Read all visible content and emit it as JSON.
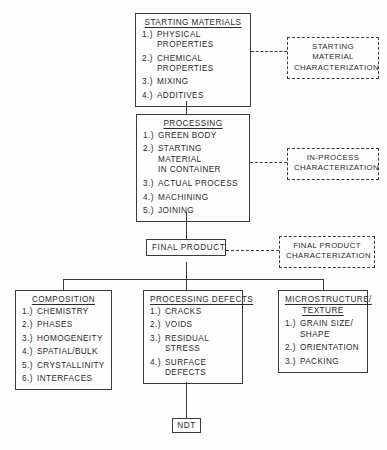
{
  "diagram": {
    "stroke_color": "#3a3a3a",
    "background_color": "#fdfdfd"
  },
  "boxes": {
    "starting_materials": {
      "title": "STARTING MATERIALS",
      "items": [
        {
          "num": "1.)",
          "text": "PHYSICAL PROPERTIES"
        },
        {
          "num": "2.)",
          "text": "CHEMICAL PROPERTIES"
        },
        {
          "num": "3.)",
          "text": "MIXING"
        },
        {
          "num": "4.)",
          "text": "ADDITIVES"
        }
      ]
    },
    "processing": {
      "title": "PROCESSING",
      "items": [
        {
          "num": "1.)",
          "text": "GREEN BODY"
        },
        {
          "num": "2.)",
          "text": "STARTING MATERIAL\n     IN CONTAINER"
        },
        {
          "num": "3.)",
          "text": "ACTUAL PROCESS"
        },
        {
          "num": "4.)",
          "text": "MACHINING"
        },
        {
          "num": "5.)",
          "text": "JOINING"
        }
      ]
    },
    "final_product": {
      "label": "FINAL PRODUCT"
    },
    "composition": {
      "title": "COMPOSITION",
      "items": [
        {
          "num": "1.)",
          "text": "CHEMISTRY"
        },
        {
          "num": "2.)",
          "text": "PHASES"
        },
        {
          "num": "3.)",
          "text": "HOMOGENEITY"
        },
        {
          "num": "4.)",
          "text": "SPATIAL/BULK"
        },
        {
          "num": "5.)",
          "text": "CRYSTALLINITY"
        },
        {
          "num": "6.)",
          "text": "INTERFACES"
        }
      ]
    },
    "processing_defects": {
      "title": "PROCESSING DEFECTS",
      "items": [
        {
          "num": "1.)",
          "text": "CRACKS"
        },
        {
          "num": "2.)",
          "text": "VOIDS"
        },
        {
          "num": "3.)",
          "text": "RESIDUAL STRESS"
        },
        {
          "num": "4.)",
          "text": "SURFACE DEFECTS"
        }
      ]
    },
    "microstructure": {
      "title": "MICROSTRUCTURE/\nTEXTURE",
      "items": [
        {
          "num": "1.)",
          "text": "GRAIN SIZE/\n      SHAPE"
        },
        {
          "num": "2.)",
          "text": "ORIENTATION"
        },
        {
          "num": "3.)",
          "text": "PACKING"
        }
      ]
    },
    "ndt": {
      "label": "NDT"
    }
  },
  "characterization": {
    "starting_material": "STARTING MATERIAL\nCHARACTERIZATION",
    "in_process": "IN-PROCESS\nCHARACTERIZATION",
    "final_product": "FINAL PRODUCT\nCHARACTERIZATION"
  }
}
